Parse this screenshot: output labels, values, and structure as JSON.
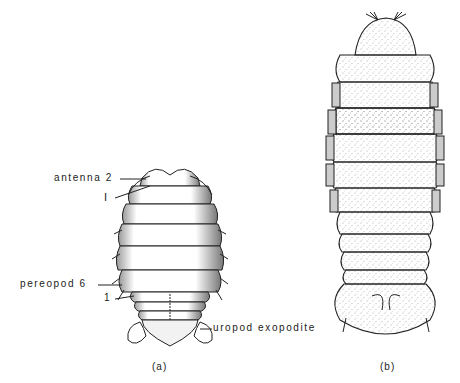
{
  "figure": {
    "panel_a": {
      "caption": "(a)",
      "labels": {
        "antenna": "antenna 2",
        "roman_one": "I",
        "pereopod": "pereopod 6",
        "one": "1",
        "uropod": "uropod exopodite"
      }
    },
    "panel_b": {
      "caption": "(b)"
    }
  }
}
